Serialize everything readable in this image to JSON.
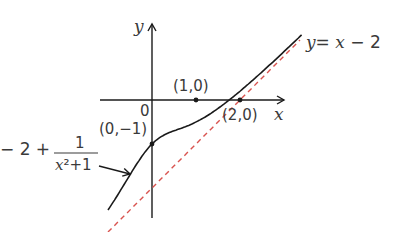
{
  "chart_data": {
    "type": "line",
    "title": "",
    "xlabel": "x",
    "ylabel": "y",
    "origin_label": "0",
    "grid": false,
    "series": [
      {
        "name": "y = x - 2 + 1/(x^2+1)",
        "style": "solid",
        "color": "#1a1a1a",
        "x": [
          -1.0,
          -0.75,
          -0.5,
          -0.25,
          0,
          0.25,
          0.5,
          0.75,
          1.0,
          1.5,
          2.0,
          2.5,
          3.0,
          3.4
        ],
        "y": [
          -2.5,
          -2.11,
          -1.7,
          -1.31,
          -1.0,
          -0.81,
          -0.7,
          -0.61,
          -0.5,
          -0.19,
          0.2,
          0.64,
          1.1,
          1.48
        ]
      },
      {
        "name": "y = x - 2",
        "style": "dashed",
        "color": "#d9534f",
        "x": [
          -1.0,
          3.4
        ],
        "y": [
          -3.0,
          1.4
        ]
      }
    ],
    "points": [
      {
        "label": "(1,0)",
        "x": 1,
        "y": 0
      },
      {
        "label": "(2,0)",
        "x": 2,
        "y": 0
      },
      {
        "label": "(0,-1)",
        "x": 0,
        "y": -1
      }
    ],
    "annotations": {
      "asymptote_label": "y = x − 2",
      "curve_label_prefix": "− 2 + ",
      "curve_label_num": "1",
      "curve_label_den": "x²+1"
    },
    "xlim": [
      -1.1,
      3.6
    ],
    "ylim": [
      -2.9,
      1.9
    ]
  },
  "labels": {
    "y_axis": "y",
    "x_axis": "x",
    "origin": "0",
    "p1": "(1,0)",
    "p2": "(2,0)",
    "p3": "(0,−1)",
    "asym_y": "y",
    "asym_eq": "= ",
    "asym_x": "x",
    "asym_rest": " − 2",
    "curve_prefix": "− 2 + ",
    "curve_num": "1",
    "curve_den_x": "x",
    "curve_den_rest": "²+1"
  }
}
